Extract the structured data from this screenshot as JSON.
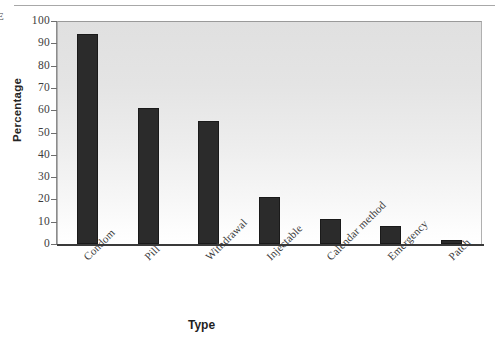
{
  "chart_data": {
    "type": "bar",
    "title": "",
    "xlabel": "Type",
    "ylabel": "Percentage",
    "categories": [
      "Condom",
      "Pill",
      "Withdrawal",
      "Injectable",
      "Calendar method",
      "Emergency",
      "Patch"
    ],
    "values": [
      94,
      61,
      55,
      21,
      11,
      8,
      2
    ],
    "ylim": [
      0,
      100
    ],
    "ytick_labels": [
      "0",
      "10",
      "20",
      "30",
      "40",
      "50",
      "60",
      "70",
      "80",
      "90",
      "100"
    ],
    "ytick_values": [
      0,
      10,
      20,
      30,
      40,
      50,
      60,
      70,
      80,
      90,
      100
    ],
    "grid": false,
    "legend": "none",
    "bar_color": "#2b2b2b",
    "plot_background": "#e8e8e8"
  },
  "page": {
    "edge_glyph": "E"
  }
}
